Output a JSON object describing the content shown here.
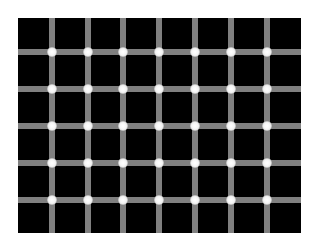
{
  "figure": {
    "background_color": "#ffffff",
    "panel": {
      "x": 18,
      "y": 18,
      "width": 283,
      "height": 215,
      "color": "#000000"
    },
    "grid": {
      "line_color": "#808080",
      "line_width": 6,
      "vertical_lines_x": [
        52,
        88,
        123,
        159,
        195,
        231,
        267
      ],
      "horizontal_lines_y": [
        52,
        89,
        126,
        163,
        200
      ],
      "dot_color": "#ffffff",
      "dot_radius": 4.8,
      "dot_count": 35
    }
  }
}
